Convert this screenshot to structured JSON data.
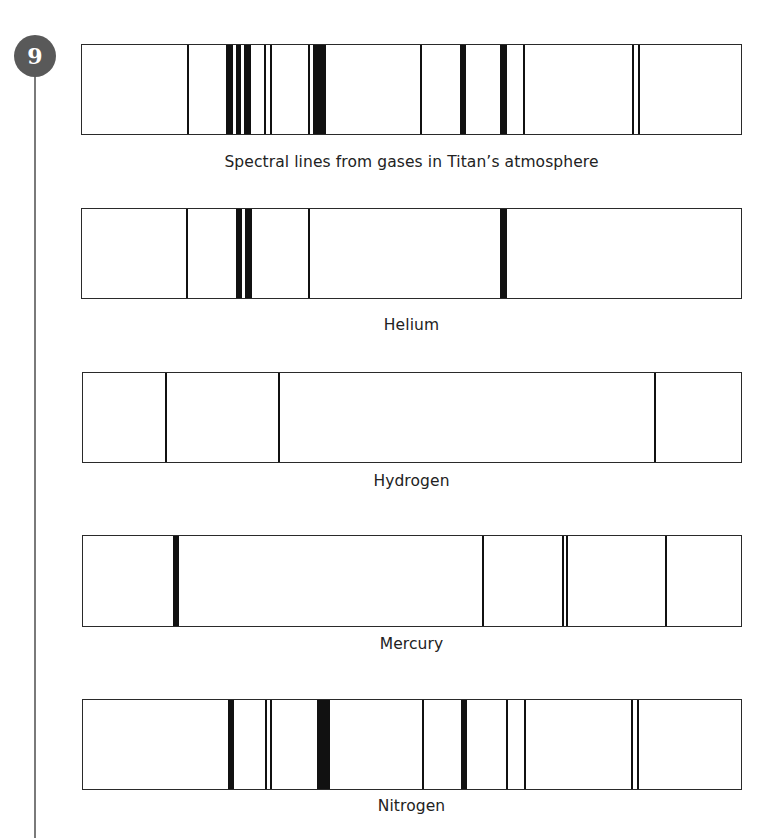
{
  "badge": {
    "number": "9",
    "color": "#595959"
  },
  "chart_data": {
    "type": "spectral-line-diagram",
    "note": "Emission/absorption line positions given as pixel offsets from the left edge of each 660px-wide spectrum box; widths in px",
    "panels": [
      {
        "id": "titan",
        "caption": "Spectral lines from gases in Titan’s atmosphere",
        "box": {
          "left": 81,
          "top": 44,
          "width": 661,
          "height": 91
        },
        "lines": [
          {
            "x": 105,
            "w": 1.5
          },
          {
            "x": 144,
            "w": 7
          },
          {
            "x": 154,
            "w": 5
          },
          {
            "x": 162,
            "w": 7
          },
          {
            "x": 182,
            "w": 1.5
          },
          {
            "x": 188,
            "w": 1.5
          },
          {
            "x": 226,
            "w": 1.5
          },
          {
            "x": 231,
            "w": 13
          },
          {
            "x": 338,
            "w": 1.5
          },
          {
            "x": 378,
            "w": 6
          },
          {
            "x": 418,
            "w": 7
          },
          {
            "x": 441,
            "w": 1.5
          },
          {
            "x": 550,
            "w": 1.5
          },
          {
            "x": 556,
            "w": 1.5
          }
        ]
      },
      {
        "id": "helium",
        "caption": "Helium",
        "box": {
          "left": 81,
          "top": 208,
          "width": 661,
          "height": 91
        },
        "lines": [
          {
            "x": 104,
            "w": 1.5
          },
          {
            "x": 154,
            "w": 6
          },
          {
            "x": 163,
            "w": 7
          },
          {
            "x": 226,
            "w": 1.5
          },
          {
            "x": 418,
            "w": 7
          }
        ]
      },
      {
        "id": "hydrogen",
        "caption": "Hydrogen",
        "box": {
          "left": 82,
          "top": 372,
          "width": 660,
          "height": 91
        },
        "lines": [
          {
            "x": 82,
            "w": 1.5
          },
          {
            "x": 195,
            "w": 1.5
          },
          {
            "x": 571,
            "w": 1.5
          }
        ]
      },
      {
        "id": "mercury",
        "caption": "Mercury",
        "box": {
          "left": 82,
          "top": 535,
          "width": 660,
          "height": 92
        },
        "lines": [
          {
            "x": 90,
            "w": 6
          },
          {
            "x": 399,
            "w": 1.5
          },
          {
            "x": 479,
            "w": 1.5
          },
          {
            "x": 483,
            "w": 1.5
          },
          {
            "x": 582,
            "w": 1.5
          }
        ]
      },
      {
        "id": "nitrogen",
        "caption": "Nitrogen",
        "box": {
          "left": 82,
          "top": 699,
          "width": 660,
          "height": 91
        },
        "lines": [
          {
            "x": 145,
            "w": 6
          },
          {
            "x": 182,
            "w": 1.5
          },
          {
            "x": 187,
            "w": 1.5
          },
          {
            "x": 234,
            "w": 13
          },
          {
            "x": 339,
            "w": 1.5
          },
          {
            "x": 378,
            "w": 6
          },
          {
            "x": 423,
            "w": 1.5
          },
          {
            "x": 441,
            "w": 1.5
          },
          {
            "x": 548,
            "w": 1.5
          },
          {
            "x": 554,
            "w": 1.5
          }
        ]
      }
    ],
    "captions": {
      "titan": {
        "top": 153
      },
      "helium": {
        "top": 316
      },
      "hydrogen": {
        "top": 472
      },
      "mercury": {
        "top": 635
      },
      "nitrogen": {
        "top": 797
      }
    }
  }
}
